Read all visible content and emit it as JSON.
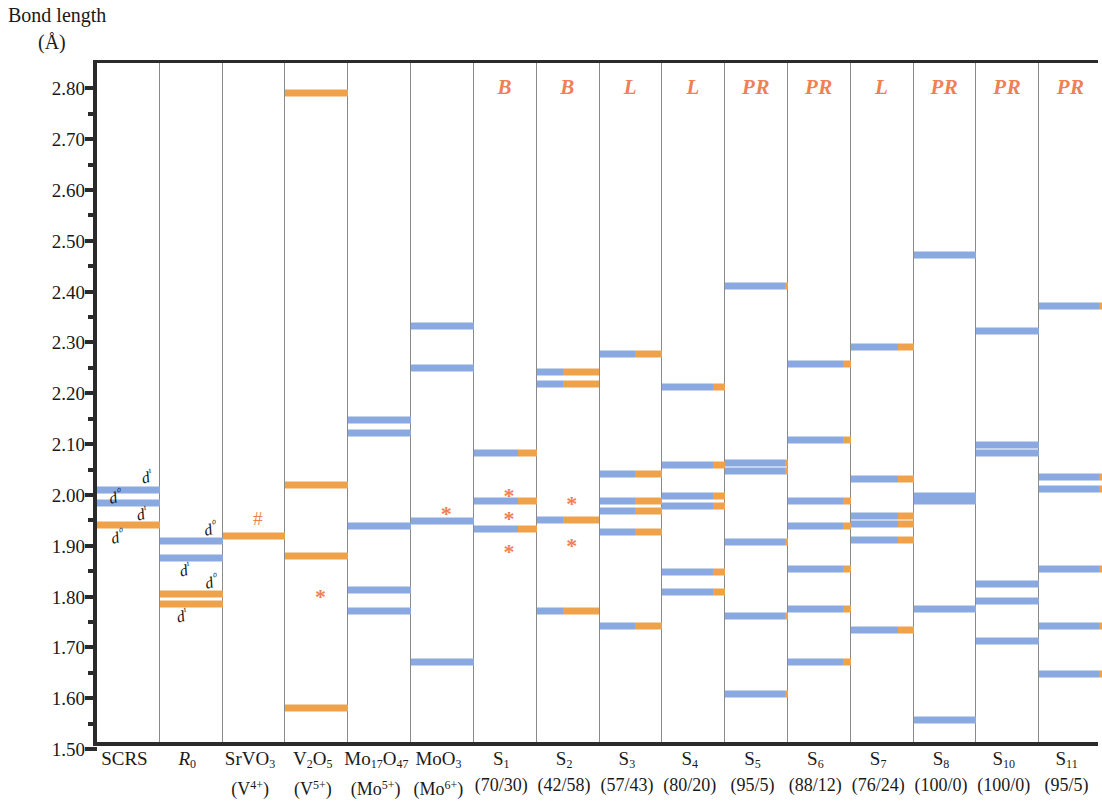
{
  "axis_title": {
    "line1": "Bond length",
    "line2": "(Å)"
  },
  "yaxis": {
    "min": 1.5,
    "max": 2.85,
    "major_ticks": [
      "2.80",
      "2.70",
      "2.60",
      "2.50",
      "2.40",
      "2.30",
      "2.20",
      "2.10",
      "2.00",
      "1.90",
      "1.80",
      "1.70",
      "1.60",
      "1.50"
    ],
    "major_values": [
      2.8,
      2.7,
      2.6,
      2.5,
      2.4,
      2.3,
      2.2,
      2.1,
      2.0,
      1.9,
      1.8,
      1.7,
      1.6,
      1.5
    ],
    "minor_values": [
      2.75,
      2.65,
      2.55,
      2.45,
      2.35,
      2.25,
      2.15,
      2.05,
      1.95,
      1.85,
      1.75,
      1.65,
      1.55
    ]
  },
  "legend_colors": {
    "d0": "#f0a24a",
    "d1": "#8aa9e0",
    "mark": "#ef7f55",
    "axis": "#2b2b2b",
    "divider": "#8a8a8a"
  },
  "annotations": {
    "scrs_d1_upper": "d¹",
    "scrs_d0_upper": "d⁰",
    "scrs_d1_lower": "d¹",
    "scrs_d0_lower": "d⁰",
    "r0_d0_upper": "d⁰",
    "r0_d1_upper": "d¹",
    "r0_d0_lower": "d⁰",
    "r0_d1_lower": "d¹"
  },
  "chart_data": {
    "type": "bar",
    "title": "Bond length (Å)",
    "xlabel": "",
    "ylabel": "Bond length (Å)",
    "ylim": [
      1.5,
      2.85
    ],
    "grid": false,
    "legend": "none",
    "orientation": "horizontal-level-lines",
    "note": "Each column is a compound/sample; each horizontal line is a metal-oxygen bond length. Line color encodes oxidation-state character: blue = d1 (reduced, e.g. V4+/Mo5+), orange = d0 (oxidised, e.g. V5+/Mo6+). Split lines show mixed d0/d1 fraction given in parentheses under each label.",
    "columns": [
      {
        "id": "SCRS",
        "label_line1": "SCRS",
        "label_line2": "",
        "header": "",
        "d1_fraction": null,
        "marks": [],
        "levels": [
          {
            "value": 2.01,
            "d1_frac": 1.0
          },
          {
            "value": 1.985,
            "d1_frac": 1.0
          },
          {
            "value": 1.94,
            "d1_frac": 0.0
          }
        ]
      },
      {
        "id": "R0",
        "label_line1": "R₀",
        "label_line2": "",
        "header": "",
        "d1_fraction": null,
        "marks": [],
        "levels": [
          {
            "value": 1.91,
            "d1_frac": 1.0
          },
          {
            "value": 1.875,
            "d1_frac": 1.0
          },
          {
            "value": 1.805,
            "d1_frac": 0.0
          },
          {
            "value": 1.785,
            "d1_frac": 0.0
          }
        ]
      },
      {
        "id": "SrVO3",
        "label_line1": "SrVO3",
        "label_line2": "(V4+)",
        "header": "",
        "d1_fraction": 0.0,
        "marks": [
          {
            "symbol": "#",
            "value": 1.955
          }
        ],
        "levels": [
          {
            "value": 1.92,
            "d1_frac": 0.0
          }
        ]
      },
      {
        "id": "V2O5",
        "label_line1": "V2O5",
        "label_line2": "(V5+)",
        "header": "",
        "d1_fraction": 0.0,
        "marks": [
          {
            "symbol": "*",
            "value": 1.8
          }
        ],
        "levels": [
          {
            "value": 2.79,
            "d1_frac": 0.0
          },
          {
            "value": 2.02,
            "d1_frac": 0.0
          },
          {
            "value": 1.88,
            "d1_frac": 0.0
          },
          {
            "value": 1.58,
            "d1_frac": 0.0
          }
        ]
      },
      {
        "id": "Mo17O47",
        "label_line1": "Mo17O47",
        "label_line2": "(Mo5+)",
        "header": "",
        "d1_fraction": 1.0,
        "marks": [],
        "levels": [
          {
            "value": 2.148,
            "d1_frac": 1.0
          },
          {
            "value": 2.122,
            "d1_frac": 1.0
          },
          {
            "value": 1.938,
            "d1_frac": 1.0
          },
          {
            "value": 1.812,
            "d1_frac": 1.0
          },
          {
            "value": 1.772,
            "d1_frac": 1.0
          }
        ]
      },
      {
        "id": "MoO3",
        "label_line1": "MoO3",
        "label_line2": "(Mo6+)",
        "header": "",
        "d1_fraction": 1.0,
        "marks": [
          {
            "symbol": "*",
            "value": 1.962
          }
        ],
        "levels": [
          {
            "value": 2.332,
            "d1_frac": 1.0
          },
          {
            "value": 2.25,
            "d1_frac": 1.0
          },
          {
            "value": 1.948,
            "d1_frac": 1.0
          },
          {
            "value": 1.672,
            "d1_frac": 1.0
          }
        ]
      },
      {
        "id": "S1",
        "label_line1": "S1",
        "label_line2": "(70/30)",
        "header": "B",
        "d1_fraction": 0.7,
        "marks": [
          {
            "symbol": "*",
            "value": 1.998
          },
          {
            "symbol": "*",
            "value": 1.952
          },
          {
            "symbol": "*",
            "value": 1.888
          }
        ],
        "levels": [
          {
            "value": 2.082,
            "d1_frac": 0.7
          },
          {
            "value": 1.988,
            "d1_frac": 0.7
          },
          {
            "value": 1.932,
            "d1_frac": 0.7
          }
        ]
      },
      {
        "id": "S2",
        "label_line1": "S2",
        "label_line2": "(42/58)",
        "header": "B",
        "d1_fraction": 0.42,
        "marks": [
          {
            "symbol": "*",
            "value": 1.982
          },
          {
            "symbol": "*",
            "value": 1.9
          }
        ],
        "levels": [
          {
            "value": 2.242,
            "d1_frac": 0.42
          },
          {
            "value": 2.218,
            "d1_frac": 0.42
          },
          {
            "value": 1.95,
            "d1_frac": 0.42
          },
          {
            "value": 1.772,
            "d1_frac": 0.42
          }
        ]
      },
      {
        "id": "S3",
        "label_line1": "S3",
        "label_line2": "(57/43)",
        "header": "L",
        "d1_fraction": 0.57,
        "marks": [],
        "levels": [
          {
            "value": 2.278,
            "d1_frac": 0.57
          },
          {
            "value": 2.042,
            "d1_frac": 0.57
          },
          {
            "value": 1.988,
            "d1_frac": 0.57
          },
          {
            "value": 1.968,
            "d1_frac": 0.57
          },
          {
            "value": 1.928,
            "d1_frac": 0.57
          },
          {
            "value": 1.742,
            "d1_frac": 0.57
          }
        ]
      },
      {
        "id": "S4",
        "label_line1": "S4",
        "label_line2": "(80/20)",
        "header": "L",
        "d1_fraction": 0.8,
        "marks": [],
        "levels": [
          {
            "value": 2.212,
            "d1_frac": 0.8
          },
          {
            "value": 2.058,
            "d1_frac": 0.8
          },
          {
            "value": 1.998,
            "d1_frac": 0.8
          },
          {
            "value": 1.978,
            "d1_frac": 0.8
          },
          {
            "value": 1.848,
            "d1_frac": 0.8
          },
          {
            "value": 1.808,
            "d1_frac": 0.8
          }
        ]
      },
      {
        "id": "S5",
        "label_line1": "S5",
        "label_line2": "(95/5)",
        "header": "PR",
        "d1_fraction": 0.95,
        "marks": [],
        "levels": [
          {
            "value": 2.412,
            "d1_frac": 0.95
          },
          {
            "value": 2.062,
            "d1_frac": 0.95
          },
          {
            "value": 2.048,
            "d1_frac": 0.95
          },
          {
            "value": 1.908,
            "d1_frac": 0.95
          },
          {
            "value": 1.762,
            "d1_frac": 0.95
          },
          {
            "value": 1.608,
            "d1_frac": 0.95
          }
        ]
      },
      {
        "id": "S6",
        "label_line1": "S6",
        "label_line2": "(88/12)",
        "header": "PR",
        "d1_fraction": 0.88,
        "marks": [],
        "levels": [
          {
            "value": 2.258,
            "d1_frac": 0.88
          },
          {
            "value": 2.108,
            "d1_frac": 0.88
          },
          {
            "value": 1.988,
            "d1_frac": 0.88
          },
          {
            "value": 1.938,
            "d1_frac": 0.88
          },
          {
            "value": 1.855,
            "d1_frac": 0.88
          },
          {
            "value": 1.775,
            "d1_frac": 0.88
          },
          {
            "value": 1.672,
            "d1_frac": 0.88
          }
        ]
      },
      {
        "id": "S7",
        "label_line1": "S7",
        "label_line2": "(76/24)",
        "header": "L",
        "d1_fraction": 0.76,
        "marks": [],
        "levels": [
          {
            "value": 2.292,
            "d1_frac": 0.76
          },
          {
            "value": 2.032,
            "d1_frac": 0.76
          },
          {
            "value": 1.958,
            "d1_frac": 0.76
          },
          {
            "value": 1.942,
            "d1_frac": 0.76
          },
          {
            "value": 1.912,
            "d1_frac": 0.76
          },
          {
            "value": 1.735,
            "d1_frac": 0.76
          }
        ]
      },
      {
        "id": "S8",
        "label_line1": "S8",
        "label_line2": "(100/0)",
        "header": "PR",
        "d1_fraction": 1.0,
        "marks": [],
        "levels": [
          {
            "value": 2.472,
            "d1_frac": 1.0
          },
          {
            "value": 1.998,
            "d1_frac": 1.0
          },
          {
            "value": 1.988,
            "d1_frac": 1.0
          },
          {
            "value": 1.775,
            "d1_frac": 1.0
          },
          {
            "value": 1.558,
            "d1_frac": 1.0
          }
        ]
      },
      {
        "id": "S10",
        "label_line1": "S10",
        "label_line2": "(100/0)",
        "header": "PR",
        "d1_fraction": 1.0,
        "marks": [],
        "levels": [
          {
            "value": 2.322,
            "d1_frac": 1.0
          },
          {
            "value": 2.098,
            "d1_frac": 1.0
          },
          {
            "value": 2.082,
            "d1_frac": 1.0
          },
          {
            "value": 1.825,
            "d1_frac": 1.0
          },
          {
            "value": 1.792,
            "d1_frac": 1.0
          },
          {
            "value": 1.712,
            "d1_frac": 1.0
          }
        ]
      },
      {
        "id": "S11",
        "label_line1": "S11",
        "label_line2": "(95/5)",
        "header": "PR",
        "d1_fraction": 0.95,
        "marks": [],
        "levels": [
          {
            "value": 2.372,
            "d1_frac": 0.95
          },
          {
            "value": 2.035,
            "d1_frac": 0.95
          },
          {
            "value": 2.012,
            "d1_frac": 0.95
          },
          {
            "value": 1.855,
            "d1_frac": 0.95
          },
          {
            "value": 1.742,
            "d1_frac": 0.95
          },
          {
            "value": 1.648,
            "d1_frac": 0.95
          }
        ]
      }
    ]
  }
}
